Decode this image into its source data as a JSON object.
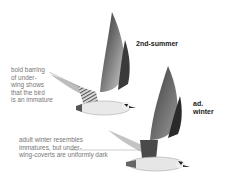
{
  "plate": {
    "subject": "gull/tern in flight, two plumages",
    "birds": [
      {
        "id": "upper",
        "age_label": "2nd-summer"
      },
      {
        "id": "lower",
        "age_label_line1": "ad.",
        "age_label_line2": "winter"
      }
    ],
    "annotations": [
      {
        "id": "underwing-note",
        "lines": [
          "bold barring",
          "of under-",
          "wing shows",
          "that the bird",
          "is an immature"
        ]
      },
      {
        "id": "adult-note",
        "lines": [
          "adult winter resembles",
          "immatures, but under-",
          "wing-coverts are uniformly dark"
        ]
      }
    ],
    "colors": {
      "background": "#ffffff",
      "label": "#222222",
      "note": "#777777",
      "bird_dark": "#2a2a2a",
      "bird_mid": "#8a8a8a",
      "bird_light": "#d8d8d8"
    }
  }
}
